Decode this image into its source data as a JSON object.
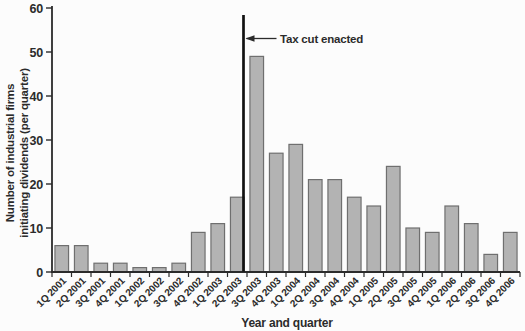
{
  "figure": {
    "background": "#fcfcfc"
  },
  "chart_data": {
    "type": "bar",
    "xlabel": "Year and quarter",
    "ylabel_lines": [
      "Number of industrial firms",
      "initiating dividends (per quarter)"
    ],
    "categories": [
      "1Q 2001",
      "2Q 2001",
      "3Q 2001",
      "4Q 2001",
      "1Q 2002",
      "2Q 2002",
      "3Q 2002",
      "4Q 2002",
      "1Q 2003",
      "2Q 2003",
      "3Q 2003",
      "4Q 2003",
      "1Q 2004",
      "2Q 2004",
      "3Q 2004",
      "4Q 2004",
      "1Q 2005",
      "2Q 2005",
      "3Q 2005",
      "4Q 2005",
      "1Q 2006",
      "2Q 2006",
      "3Q 2006",
      "4Q 2006"
    ],
    "values": [
      6,
      6,
      2,
      2,
      1,
      1,
      2,
      9,
      11,
      17,
      49,
      27,
      29,
      21,
      21,
      17,
      15,
      24,
      10,
      9,
      15,
      11,
      4,
      9
    ],
    "ylim": [
      0,
      60
    ],
    "yticks": [
      0,
      10,
      20,
      30,
      40,
      50,
      60
    ],
    "grid": false,
    "bar_fill": "#b3b3b3",
    "bar_stroke": "#6f6f6f",
    "axis_color": "#2b2b2b",
    "text_color": "#2b2b2b",
    "annotation": {
      "label": "Tax cut enacted",
      "x_category": "3Q 2003",
      "position": "left-edge-of-category",
      "line_color": "#111111"
    }
  }
}
